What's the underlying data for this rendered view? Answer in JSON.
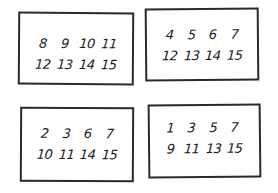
{
  "cards": [
    {
      "label": "top-left card",
      "numbers": [
        "8",
        "9",
        "10",
        "11",
        "12",
        "13",
        "14",
        "15"
      ]
    },
    {
      "label": "top-right card",
      "numbers": [
        "4",
        "5",
        "6",
        "7",
        "12",
        "13",
        "14",
        "15"
      ]
    },
    {
      "label": "bottom-left card",
      "numbers": [
        "2",
        "3",
        "6",
        "7",
        "10",
        "11",
        "14",
        "15"
      ]
    },
    {
      "label": "bottom-right card",
      "numbers": [
        "1",
        "3",
        "5",
        "7",
        "9",
        "11",
        "13",
        "15"
      ]
    }
  ]
}
